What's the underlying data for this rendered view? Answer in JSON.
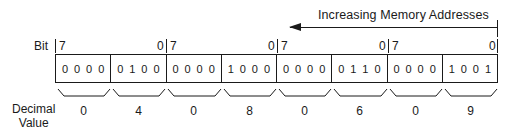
{
  "header": {
    "direction_label": "Increasing Memory Addresses"
  },
  "bit_row": {
    "label": "Bit",
    "bytes": [
      {
        "high": "7",
        "low": "0"
      },
      {
        "high": "7",
        "low": "0"
      },
      {
        "high": "7",
        "low": "0"
      },
      {
        "high": "7",
        "low": "0"
      }
    ]
  },
  "nibbles": [
    {
      "bits": [
        "0",
        "0",
        "0",
        "0"
      ],
      "decimal": "0"
    },
    {
      "bits": [
        "0",
        "1",
        "0",
        "0"
      ],
      "decimal": "4"
    },
    {
      "bits": [
        "0",
        "0",
        "0",
        "0"
      ],
      "decimal": "0"
    },
    {
      "bits": [
        "1",
        "0",
        "0",
        "0"
      ],
      "decimal": "8"
    },
    {
      "bits": [
        "0",
        "0",
        "0",
        "0"
      ],
      "decimal": "0"
    },
    {
      "bits": [
        "0",
        "1",
        "1",
        "0"
      ],
      "decimal": "6"
    },
    {
      "bits": [
        "0",
        "0",
        "0",
        "0"
      ],
      "decimal": "0"
    },
    {
      "bits": [
        "1",
        "0",
        "0",
        "1"
      ],
      "decimal": "9"
    }
  ],
  "decimal_row": {
    "label_line1": "Decimal",
    "label_line2": "Value"
  }
}
